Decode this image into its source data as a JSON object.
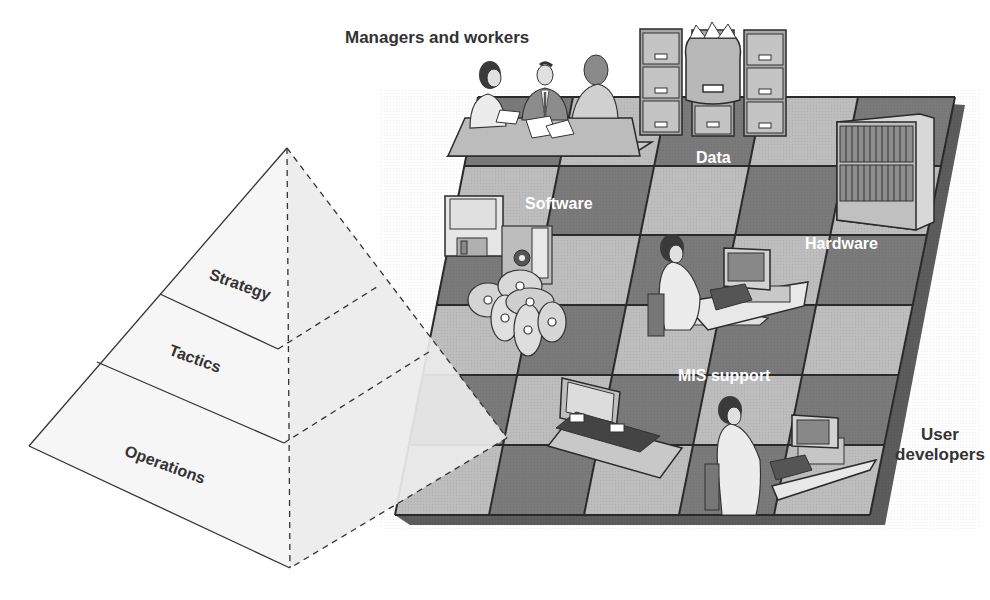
{
  "diagram": {
    "type": "illustration",
    "pyramid": {
      "levels": [
        {
          "label": "Strategy"
        },
        {
          "label": "Tactics"
        },
        {
          "label": "Operations"
        }
      ]
    },
    "board": {
      "labels": {
        "managers": "Managers and workers",
        "data": "Data",
        "software": "Software",
        "hardware": "Hardware",
        "mis_support": "MIS support",
        "user_developers_line1": "User",
        "user_developers_line2": "developers"
      }
    },
    "colors": {
      "board_dark": "#7a7a7a",
      "board_light": "#bdbdbd",
      "board_frame": "#5c5c5c",
      "grid_line": "#2a2a2a",
      "pyramid_face": "#f4f4f4",
      "pyramid_side": "#e8e8e8",
      "label_dark": "#333333"
    }
  }
}
